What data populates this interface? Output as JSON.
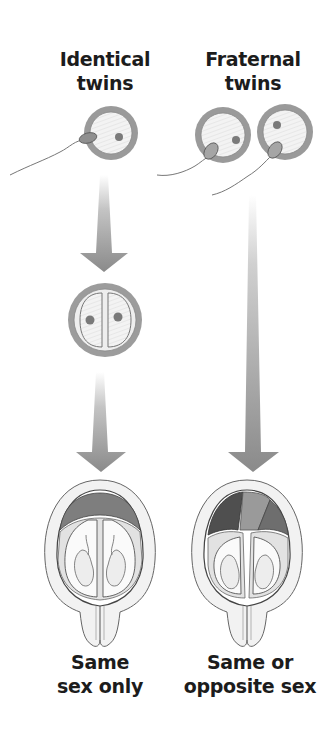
{
  "diagram": {
    "columns": [
      {
        "id": "identical",
        "title_line1": "Identical",
        "title_line2": "twins",
        "caption_line1": "Same",
        "caption_line2": "sex only",
        "stages": [
          "one-egg-one-sperm",
          "egg-splits-into-two-cells",
          "twins-share-one-placenta"
        ]
      },
      {
        "id": "fraternal",
        "title_line1": "Fraternal",
        "title_line2": "twins",
        "caption_line1": "Same or",
        "caption_line2": "opposite sex",
        "stages": [
          "two-eggs-two-sperm",
          "twins-with-separate-placentas"
        ]
      }
    ],
    "colors": {
      "background": "#ffffff",
      "text": "#1c1c1c",
      "arrow": "#8a8a8a",
      "egg_ring": "#9a9a9a",
      "egg_fill": "#f1f1f1",
      "placenta": "#7e7e7e",
      "outline": "#555555"
    }
  }
}
